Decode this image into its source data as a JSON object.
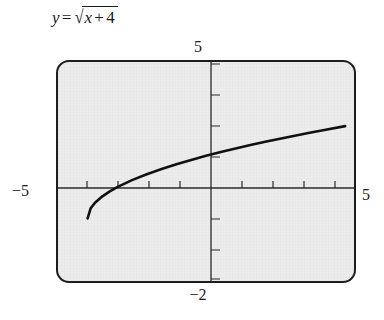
{
  "figure": {
    "equation": {
      "lhs": "y",
      "equals": "=",
      "radical_sign": "√",
      "radicand_var": "x",
      "radicand_op": "+",
      "radicand_num": "4",
      "full_text": "y = √(x + 4)"
    },
    "window_labels": {
      "ymax": "5",
      "ymin": "−2",
      "xmin": "−5",
      "xmax": "5"
    }
  },
  "chart_data": {
    "type": "line",
    "xlabel": "",
    "ylabel": "",
    "xlim": [
      -5,
      5
    ],
    "ylim": [
      -2,
      5
    ],
    "grid": false,
    "legend": false,
    "axis_ticks": {
      "x": [
        -4,
        -3,
        -2,
        -1,
        1,
        2,
        3,
        4
      ],
      "y": [
        -1,
        1,
        2,
        3,
        4
      ]
    },
    "tick_interval": 1,
    "series": [
      {
        "name": "y = sqrt(x + 4)",
        "color": "#111111",
        "domain_start": -4,
        "domain_end": 4.7,
        "x": [
          -4,
          -3.9,
          -3.75,
          -3.5,
          -3.25,
          -3,
          -2.5,
          -2,
          -1.5,
          -1,
          -0.5,
          0,
          0.5,
          1,
          1.5,
          2,
          2.5,
          3,
          3.5,
          4,
          4.7
        ],
        "y": [
          0,
          0.316,
          0.5,
          0.707,
          0.866,
          1,
          1.225,
          1.414,
          1.581,
          1.732,
          1.871,
          2,
          2.121,
          2.236,
          2.345,
          2.449,
          2.55,
          2.646,
          2.739,
          2.828,
          2.95
        ]
      }
    ]
  }
}
